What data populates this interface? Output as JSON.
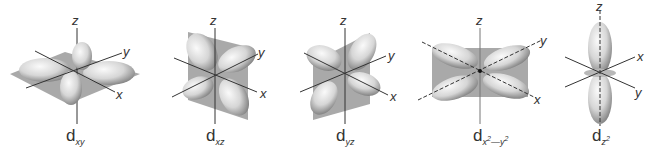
{
  "figure": {
    "colors": {
      "background": "#ffffff",
      "lobe_light": "#f2f2f2",
      "lobe_dark": "#8a8a8a",
      "plane": "#9a9a9a",
      "axis": "#333333",
      "text": "#333333"
    },
    "orbitals": [
      {
        "id": "dxy",
        "base": "d",
        "subscript": "xy",
        "axes": [
          "z",
          "y",
          "x"
        ]
      },
      {
        "id": "dxz",
        "base": "d",
        "subscript": "xz",
        "axes": [
          "z",
          "y",
          "x"
        ]
      },
      {
        "id": "dyz",
        "base": "d",
        "subscript": "yz",
        "axes": [
          "z",
          "y",
          "x"
        ]
      },
      {
        "id": "dx2-y2",
        "base": "d",
        "subscript": "x",
        "sub_sup1": "2",
        "sub_mid": "—y",
        "sub_sup2": "2",
        "axes": [
          "z",
          "y",
          "x"
        ]
      },
      {
        "id": "dz2",
        "base": "d",
        "subscript": "z",
        "sub_sup1": "2",
        "axes": [
          "z",
          "x",
          "y"
        ]
      }
    ]
  }
}
